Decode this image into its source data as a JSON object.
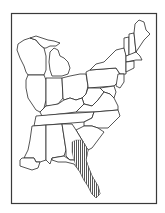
{
  "map": {
    "region": "Eastern United States",
    "style": "line-art outline map",
    "colors": {
      "outline": "#2a2a2a",
      "frame": "#3a3a3a",
      "background": "#ffffff",
      "hatch": "#444444"
    },
    "range_highlight": {
      "pattern": "vertical hatching",
      "areas": [
        "southeastern Georgia",
        "Florida peninsula"
      ]
    }
  }
}
